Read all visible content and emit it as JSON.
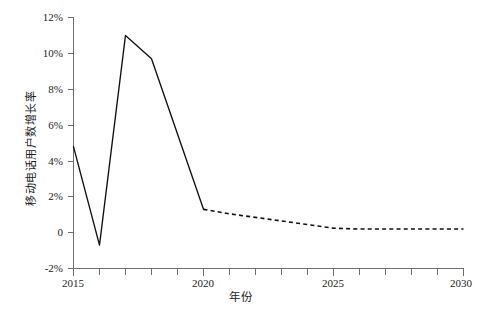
{
  "figure": {
    "ylabel": "移动电话用户数增长率",
    "xlabel": "年份",
    "caption": ""
  },
  "axes": {
    "y_ticks": [
      "12%",
      "10%",
      "8%",
      "6%",
      "4%",
      "2%",
      "0",
      "-2%"
    ],
    "x_ticks": [
      "2015",
      "2020",
      "2025",
      "2030"
    ]
  },
  "chart_data": {
    "type": "line",
    "title": "",
    "xlabel": "年份",
    "ylabel": "移动电话用户数增长率",
    "xlim": [
      2015,
      2030
    ],
    "ylim": [
      -2,
      12
    ],
    "y_unit": "percent",
    "y_tick_values": [
      12,
      10,
      8,
      6,
      4,
      2,
      0,
      -2
    ],
    "x_tick_values": [
      2015,
      2020,
      2025,
      2030
    ],
    "x_minor_tick_step": 1,
    "grid": false,
    "legend": "none",
    "series": [
      {
        "name": "历史值",
        "style": "solid",
        "color": "#111111",
        "x": [
          2015,
          2016,
          2017,
          2018,
          2020
        ],
        "values": [
          4.8,
          -0.7,
          11.0,
          9.7,
          1.3
        ]
      },
      {
        "name": "预测值",
        "style": "dashed",
        "color": "#111111",
        "x": [
          2020,
          2021,
          2022,
          2023,
          2024,
          2025,
          2026,
          2027,
          2028,
          2029,
          2030
        ],
        "values": [
          1.3,
          1.05,
          0.85,
          0.65,
          0.45,
          0.25,
          0.2,
          0.2,
          0.2,
          0.2,
          0.2
        ]
      }
    ]
  }
}
